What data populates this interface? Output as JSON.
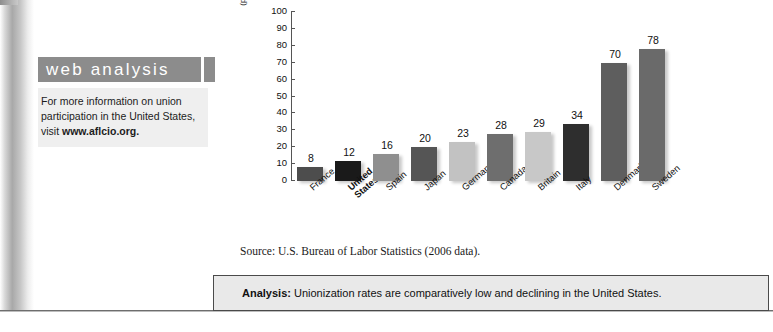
{
  "sidebar": {
    "title": "web analysis",
    "body_line1": "For more information on union",
    "body_line2": "participation in the United States,",
    "body_line3_prefix": "visit ",
    "body_link": "www.aflcio.org."
  },
  "chart_data": {
    "type": "bar",
    "title": "",
    "xlabel": "",
    "ylabel_line1": "UNIONIZATION RATE",
    "ylabel_line2": "(percent of civilian employees)",
    "ylim": [
      0,
      100
    ],
    "yticks": [
      100,
      90,
      80,
      70,
      60,
      50,
      40,
      30,
      20,
      10,
      0
    ],
    "grid": false,
    "legend": "none",
    "categories": [
      "France",
      "United States",
      "Spain",
      "Japan",
      "Germany",
      "Canada",
      "Britain",
      "Italy",
      "Denmark",
      "Sweden"
    ],
    "category_lines": [
      [
        "France"
      ],
      [
        "United",
        "States"
      ],
      [
        "Spain"
      ],
      [
        "Japan"
      ],
      [
        "Germany"
      ],
      [
        "Canada"
      ],
      [
        "Britain"
      ],
      [
        "Italy"
      ],
      [
        "Denmark"
      ],
      [
        "Sweden"
      ]
    ],
    "category_emphasis": [
      false,
      true,
      false,
      false,
      false,
      false,
      false,
      false,
      false,
      false
    ],
    "values": [
      8,
      12,
      16,
      20,
      23,
      28,
      29,
      34,
      70,
      78
    ],
    "bar_colors": [
      "#4d4d4d",
      "#1a1a1a",
      "#8f8f8f",
      "#555555",
      "#c2c2c2",
      "#6e6e6e",
      "#c8c8c8",
      "#2e2e2e",
      "#5e5e5e",
      "#6a6a6a"
    ]
  },
  "source": {
    "text": "Source: U.S. Bureau of Labor Statistics (2006 data)."
  },
  "analysis": {
    "label": "Analysis:",
    "text": " Unionization rates are comparatively low and declining in the United States."
  }
}
